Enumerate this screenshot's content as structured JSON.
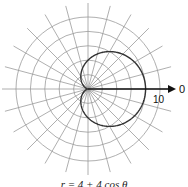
{
  "chart_data": {
    "type": "polar-line",
    "title": "",
    "caption": "r = 4 + 4 cos θ",
    "equation": "r = 4 + 4*cos(theta)",
    "r_axis": {
      "max": 10,
      "ring_step": 2,
      "rings": [
        2,
        4,
        6,
        8,
        10
      ],
      "tick_label": "10"
    },
    "theta_axis": {
      "spoke_step_deg": 15,
      "zero_label": "0"
    },
    "series": [
      {
        "name": "cardioid",
        "a": 4,
        "b": 4,
        "r_max": 8,
        "r_min": 0
      }
    ],
    "grid": true,
    "colors": {
      "grid": "#9a9a9a",
      "curve": "#333333",
      "axis": "#111111"
    }
  }
}
